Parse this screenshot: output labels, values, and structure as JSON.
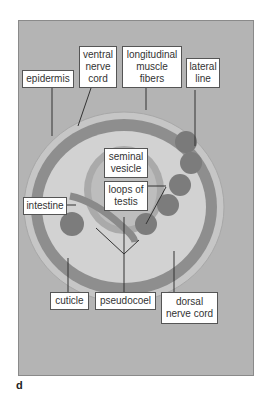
{
  "figure": {
    "panel_letter": "d",
    "colors": {
      "background": "#b4b4b4",
      "cuticle": "#c4c4c4",
      "muscle_layer": "#8e8e8e",
      "pseudocoel": "#d0d0d0",
      "testis_loops": "#7c7c7c",
      "label_bg": "#ffffff",
      "leader_line": "#333333"
    },
    "labels": {
      "epidermis": "epidermis",
      "ventral_nerve_cord": "ventral\nnerve\ncord",
      "longitudinal_muscle_fibers": "longitudinal\nmuscle\nfibers",
      "lateral_line": "lateral\nline",
      "seminal_vesicle": "seminal\nvesicle",
      "loops_of_testis": "loops of\ntestis",
      "intestine": "intestine",
      "cuticle": "cuticle",
      "pseudocoel": "pseudocoel",
      "dorsal_nerve_cord": "dorsal\nnerve cord"
    }
  }
}
